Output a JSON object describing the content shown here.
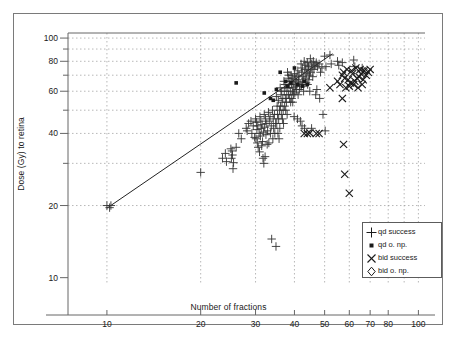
{
  "chart_data": {
    "type": "scatter",
    "title": "",
    "xlabel": "Number of fractions",
    "ylabel": "Dose (Gy) to retina",
    "xscale": "log",
    "yscale": "log",
    "xlim": [
      7.5,
      105
    ],
    "ylim": [
      9.5,
      105
    ],
    "xticks": [
      10,
      20,
      30,
      40,
      50,
      60,
      70,
      80,
      100
    ],
    "xtick_labels": [
      "10",
      "20",
      "30",
      "40",
      "50",
      "60",
      "70",
      "80",
      "100"
    ],
    "yticks": [
      10,
      20,
      40,
      60,
      80,
      100
    ],
    "ytick_labels": [
      "10",
      "20",
      "40",
      "60",
      "80",
      "100"
    ],
    "ygrid_minor": [
      20,
      30,
      40,
      50,
      60,
      70,
      80,
      90,
      100
    ],
    "xgrid_minor": [
      10,
      20,
      30,
      40,
      50,
      60,
      70,
      80,
      90,
      100
    ],
    "grid": true,
    "grid_style": "dotted",
    "legend_position": "bottom-right",
    "trend_line": {
      "label": "regression line",
      "x0": 10.0,
      "y0": 19.5,
      "x1": 53.0,
      "y1": 86.0
    },
    "series": [
      {
        "name": "qd success",
        "marker": "plus",
        "color": "#333333",
        "points": [
          [
            10,
            20
          ],
          [
            10.3,
            20
          ],
          [
            10.2,
            19.6
          ],
          [
            20,
            27.5
          ],
          [
            23.5,
            31.5
          ],
          [
            24,
            33
          ],
          [
            24.2,
            30.5
          ],
          [
            25,
            34.5
          ],
          [
            25.2,
            33.8
          ],
          [
            25.3,
            32.5
          ],
          [
            25.1,
            31.5
          ],
          [
            25.5,
            30.2
          ],
          [
            25.4,
            28.5
          ],
          [
            26,
            35
          ],
          [
            26.5,
            40
          ],
          [
            27,
            38
          ],
          [
            28,
            42
          ],
          [
            28.5,
            44
          ],
          [
            28.2,
            41
          ],
          [
            29,
            45
          ],
          [
            29.5,
            43
          ],
          [
            29.2,
            40
          ],
          [
            29.8,
            38.5
          ],
          [
            30,
            46
          ],
          [
            30.2,
            44.5
          ],
          [
            30.5,
            43
          ],
          [
            30.3,
            41.5
          ],
          [
            30.8,
            40
          ],
          [
            30.1,
            38
          ],
          [
            30.4,
            36.5
          ],
          [
            30.6,
            35
          ],
          [
            30.9,
            33.5
          ],
          [
            31,
            47
          ],
          [
            31.2,
            45
          ],
          [
            31.5,
            43.5
          ],
          [
            31.3,
            42
          ],
          [
            31.8,
            40.5
          ],
          [
            31.1,
            39
          ],
          [
            31.6,
            37
          ],
          [
            31.4,
            35.5
          ],
          [
            31.7,
            31.5
          ],
          [
            31.9,
            30
          ],
          [
            32,
            48
          ],
          [
            32.3,
            46
          ],
          [
            32.6,
            44
          ],
          [
            32.1,
            42.5
          ],
          [
            32.8,
            41
          ],
          [
            32.4,
            39.5
          ],
          [
            32.7,
            36
          ],
          [
            32.2,
            32
          ],
          [
            33,
            49
          ],
          [
            33.4,
            47
          ],
          [
            33.2,
            45
          ],
          [
            33.7,
            43
          ],
          [
            33.5,
            40
          ],
          [
            33.1,
            36.5
          ],
          [
            33.8,
            14.5
          ],
          [
            34,
            50
          ],
          [
            34.5,
            48
          ],
          [
            34.2,
            46
          ],
          [
            34.8,
            44
          ],
          [
            34.3,
            42
          ],
          [
            34.6,
            40
          ],
          [
            34.1,
            38
          ],
          [
            34.9,
            13.5
          ],
          [
            35,
            57
          ],
          [
            35.5,
            55
          ],
          [
            35.2,
            52
          ],
          [
            35.8,
            50
          ],
          [
            35.3,
            48
          ],
          [
            35.6,
            46
          ],
          [
            35.1,
            44
          ],
          [
            35.9,
            42
          ],
          [
            35.4,
            40
          ],
          [
            35.7,
            38
          ],
          [
            36,
            62
          ],
          [
            36.4,
            60
          ],
          [
            36.2,
            58
          ],
          [
            36.7,
            56
          ],
          [
            36.5,
            54
          ],
          [
            36.1,
            52
          ],
          [
            36.8,
            50
          ],
          [
            36.3,
            48
          ],
          [
            36.6,
            46
          ],
          [
            36.9,
            44
          ],
          [
            37,
            66
          ],
          [
            37.3,
            64
          ],
          [
            37.6,
            62
          ],
          [
            37.1,
            60
          ],
          [
            37.8,
            58
          ],
          [
            37.4,
            56
          ],
          [
            37.7,
            54
          ],
          [
            37.2,
            52
          ],
          [
            37.5,
            50
          ],
          [
            37.9,
            48
          ],
          [
            38,
            72
          ],
          [
            38.4,
            70
          ],
          [
            38.2,
            68
          ],
          [
            38.7,
            66
          ],
          [
            38.5,
            64
          ],
          [
            38.1,
            62
          ],
          [
            38.8,
            60
          ],
          [
            38.3,
            58
          ],
          [
            38.6,
            56
          ],
          [
            38.9,
            54
          ],
          [
            39,
            70
          ],
          [
            39.3,
            68
          ],
          [
            39.6,
            66
          ],
          [
            39.1,
            64
          ],
          [
            39.8,
            62
          ],
          [
            39.4,
            60
          ],
          [
            39.7,
            58
          ],
          [
            39.2,
            56
          ],
          [
            39.5,
            54
          ],
          [
            39.9,
            47
          ],
          [
            40,
            71
          ],
          [
            40.5,
            69
          ],
          [
            40.2,
            67
          ],
          [
            40.8,
            65
          ],
          [
            40.3,
            63
          ],
          [
            40.6,
            61
          ],
          [
            40.1,
            59
          ],
          [
            40.9,
            46
          ],
          [
            41,
            73
          ],
          [
            41.4,
            70
          ],
          [
            41.2,
            67
          ],
          [
            41.7,
            64
          ],
          [
            41.5,
            61
          ],
          [
            41.1,
            58
          ],
          [
            41.8,
            45
          ],
          [
            42,
            78
          ],
          [
            42.4,
            75
          ],
          [
            42.2,
            72
          ],
          [
            42.7,
            69
          ],
          [
            42.5,
            66
          ],
          [
            42.1,
            63
          ],
          [
            42.8,
            60
          ],
          [
            42.3,
            43
          ],
          [
            43,
            80
          ],
          [
            43.5,
            77
          ],
          [
            43.2,
            74
          ],
          [
            43.8,
            71
          ],
          [
            43.3,
            68
          ],
          [
            43.6,
            65
          ],
          [
            43.1,
            42
          ],
          [
            44,
            79
          ],
          [
            44.4,
            76
          ],
          [
            44.2,
            73
          ],
          [
            44.7,
            70
          ],
          [
            44.5,
            67
          ],
          [
            44.1,
            64
          ],
          [
            44.8,
            60
          ],
          [
            45,
            82
          ],
          [
            45.3,
            78
          ],
          [
            45.6,
            75
          ],
          [
            45.1,
            72
          ],
          [
            45.8,
            69
          ],
          [
            45.4,
            42
          ],
          [
            46,
            80
          ],
          [
            46.5,
            77
          ],
          [
            46.2,
            74
          ],
          [
            46.8,
            58
          ],
          [
            47,
            79
          ],
          [
            47.4,
            76
          ],
          [
            47.2,
            61
          ],
          [
            48,
            78
          ],
          [
            48.5,
            72
          ],
          [
            48.2,
            56
          ],
          [
            49,
            75
          ],
          [
            49.4,
            48
          ],
          [
            50,
            84
          ],
          [
            50.5,
            76
          ],
          [
            50.2,
            41
          ],
          [
            52,
            85
          ],
          [
            52.5,
            78
          ],
          [
            55,
            80
          ],
          [
            55.5,
            77
          ],
          [
            57,
            79
          ],
          [
            62,
            81
          ],
          [
            62.5,
            76
          ],
          [
            66,
            75
          ]
        ]
      },
      {
        "name": "qd o. np.",
        "marker": "square",
        "color": "#1a1a1a",
        "points": [
          [
            26,
            65
          ],
          [
            32,
            59
          ],
          [
            33.5,
            56
          ],
          [
            34.2,
            55
          ],
          [
            35,
            61
          ],
          [
            36,
            72
          ],
          [
            37.5,
            66
          ],
          [
            38,
            63
          ],
          [
            39,
            65
          ],
          [
            40,
            75
          ],
          [
            41,
            64
          ],
          [
            42.5,
            63
          ],
          [
            43,
            66
          ],
          [
            44,
            64
          ]
        ]
      },
      {
        "name": "bid success",
        "marker": "cross",
        "color": "#1a1a1a",
        "points": [
          [
            43,
            40
          ],
          [
            44,
            40
          ],
          [
            44.8,
            40.2
          ],
          [
            47,
            40
          ],
          [
            48,
            40
          ],
          [
            55,
            66
          ],
          [
            56,
            64
          ],
          [
            57,
            70
          ],
          [
            57.5,
            72
          ],
          [
            58,
            68
          ],
          [
            58.5,
            62
          ],
          [
            59,
            74
          ],
          [
            59.5,
            67
          ],
          [
            60,
            63
          ],
          [
            60.5,
            65
          ],
          [
            61,
            73
          ],
          [
            61.5,
            71
          ],
          [
            62,
            64
          ],
          [
            62.5,
            66
          ],
          [
            63,
            75
          ],
          [
            63.5,
            68
          ],
          [
            64,
            62
          ],
          [
            64.5,
            69
          ],
          [
            65,
            74
          ],
          [
            65.5,
            71
          ],
          [
            66,
            64
          ],
          [
            66.5,
            67
          ],
          [
            67,
            73
          ],
          [
            68,
            70
          ],
          [
            69,
            72
          ],
          [
            70,
            74
          ],
          [
            57,
            56
          ],
          [
            57.5,
            36
          ],
          [
            58,
            27
          ],
          [
            60,
            22.5
          ],
          [
            52,
            62
          ]
        ]
      },
      {
        "name": "bid o. np.",
        "marker": "diamond",
        "color": "#1a1a1a",
        "points": [
          [
            66,
            72
          ],
          [
            67.5,
            73
          ]
        ]
      }
    ]
  },
  "legend": {
    "entries": [
      {
        "label": "qd success",
        "marker": "plus-icon"
      },
      {
        "label": "qd o. np.",
        "marker": "square-icon"
      },
      {
        "label": "bid success",
        "marker": "cross-icon"
      },
      {
        "label": "bid o. np.",
        "marker": "diamond-icon"
      }
    ]
  },
  "axes": {
    "x_title": "Number of fractions",
    "y_title": "Dose (Gy) to retina"
  }
}
